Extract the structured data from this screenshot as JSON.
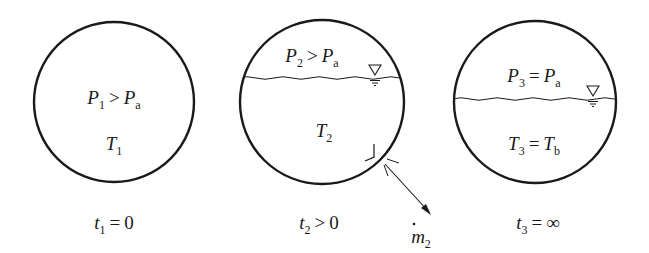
{
  "diagram": {
    "colors": {
      "stroke": "#1a1a1a",
      "background": "#ffffff"
    },
    "stages": [
      {
        "id": "stage-1",
        "center": [
          114,
          102
        ],
        "radius": 80,
        "has_liquid": false,
        "pressure_label": {
          "sym": "P",
          "sub": "1",
          "op": ">",
          "rhs_sym": "P",
          "rhs_sub": "a"
        },
        "temperature_label": {
          "sym": "T",
          "sub": "1"
        },
        "time_label": {
          "sym": "t",
          "sub": "1",
          "op": "=",
          "rhs": "0"
        }
      },
      {
        "id": "stage-2",
        "center": [
          322,
          102
        ],
        "radius": 82,
        "has_liquid": true,
        "liquid_level_y": 78,
        "pressure_label": {
          "sym": "P",
          "sub": "2",
          "op": ">",
          "rhs_sym": "P",
          "rhs_sub": "a"
        },
        "temperature_label": {
          "sym": "T",
          "sub": "2"
        },
        "time_label": {
          "sym": "t",
          "sub": "2",
          "op": ">",
          "rhs": "0"
        },
        "outflow": {
          "sym": "m",
          "dot": true,
          "sub": "2"
        }
      },
      {
        "id": "stage-3",
        "center": [
          535,
          102
        ],
        "radius": 81,
        "has_liquid": true,
        "liquid_level_y": 99,
        "pressure_label": {
          "sym": "P",
          "sub": "3",
          "op": "=",
          "rhs_sym": "P",
          "rhs_sub": "a"
        },
        "temperature_label": {
          "sym": "T",
          "sub": "3",
          "op": "=",
          "rhs_sym": "T",
          "rhs_sub": "b"
        },
        "time_label": {
          "sym": "t",
          "sub": "3",
          "op": "=",
          "rhs": "∞"
        }
      }
    ]
  }
}
